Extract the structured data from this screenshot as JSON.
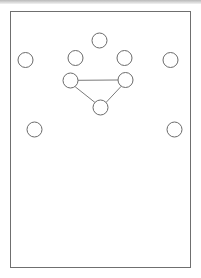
{
  "figure": {
    "title": "",
    "background_color": "#ffffff",
    "frame": {
      "label": "outer-frame",
      "x": 10.5,
      "y": 11.5,
      "width": 180,
      "height": 256,
      "stroke": "#6f6f6f",
      "stroke_width": 1,
      "fill": "#ffffff"
    },
    "top_band": {
      "label": "scan-edge-shadow",
      "color": "#c2c2c2",
      "height": 4
    }
  },
  "chart_data": {
    "type": "scatter",
    "title": "",
    "xlabel": "",
    "ylabel": "",
    "xlim": [
      0,
      201
    ],
    "ylim": [
      278,
      0
    ],
    "grid": false,
    "legend": "none",
    "node_style": {
      "radius": 7.5,
      "stroke": "#6b6b6b",
      "stroke_width": 1,
      "fill": "#ffffff"
    },
    "edge_style": {
      "stroke": "#7a7a7a",
      "stroke_width": 1
    },
    "nodes": [
      {
        "id": "n1",
        "name": "node-top-center",
        "cx": 99.5,
        "cy": 40.5,
        "r": 7.5
      },
      {
        "id": "n2",
        "name": "node-upper-left",
        "cx": 75.5,
        "cy": 58.0,
        "r": 7.5
      },
      {
        "id": "n3",
        "name": "node-upper-right",
        "cx": 124.5,
        "cy": 58.0,
        "r": 7.5
      },
      {
        "id": "n4",
        "name": "node-far-left",
        "cx": 25.5,
        "cy": 60.0,
        "r": 7.5
      },
      {
        "id": "n5",
        "name": "node-far-right",
        "cx": 170.5,
        "cy": 60.0,
        "r": 7.5
      },
      {
        "id": "n6",
        "name": "node-triangle-left",
        "cx": 70.5,
        "cy": 80.5,
        "r": 7.5
      },
      {
        "id": "n7",
        "name": "node-triangle-right",
        "cx": 125.5,
        "cy": 80.0,
        "r": 7.5
      },
      {
        "id": "n8",
        "name": "node-triangle-bottom",
        "cx": 100.5,
        "cy": 107.5,
        "r": 7.5
      },
      {
        "id": "n9",
        "name": "node-lower-left",
        "cx": 34.5,
        "cy": 129.5,
        "r": 7.5
      },
      {
        "id": "n10",
        "name": "node-lower-right",
        "cx": 174.5,
        "cy": 129.5,
        "r": 7.5
      }
    ],
    "edges": [
      {
        "name": "edge-triangle-top",
        "from": "n6",
        "to": "n7",
        "x1": 78.0,
        "y1": 80.3,
        "x2": 118.0,
        "y2": 80.0
      },
      {
        "name": "edge-triangle-left-bottom",
        "from": "n6",
        "to": "n8",
        "x1": 75.5,
        "y1": 87.0,
        "x2": 95.0,
        "y2": 102.5
      },
      {
        "name": "edge-triangle-right-bottom",
        "from": "n7",
        "to": "n8",
        "x1": 121.0,
        "y1": 86.5,
        "x2": 106.0,
        "y2": 102.5
      }
    ]
  }
}
